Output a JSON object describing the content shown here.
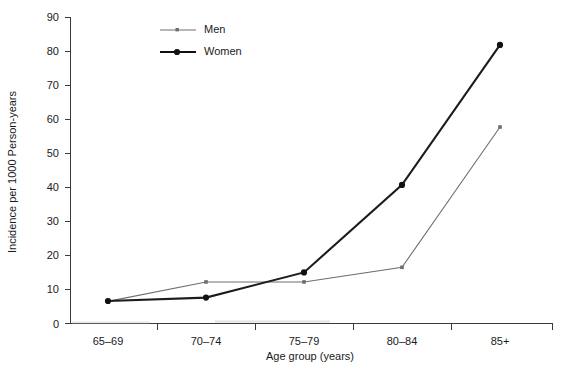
{
  "chart_data": {
    "type": "line",
    "title": "",
    "xlabel": "Age group (years)",
    "ylabel": "Incidence per 1000 Person-years",
    "categories": [
      "65–69",
      "70–74",
      "75–79",
      "80–84",
      "85+"
    ],
    "ylim": [
      0,
      90
    ],
    "yticks": [
      0,
      10,
      20,
      30,
      40,
      50,
      60,
      70,
      80,
      90
    ],
    "ytick_labels": [
      "0",
      "10",
      "20",
      "30",
      "40",
      "50",
      "60",
      "70",
      "80",
      "90"
    ],
    "grid": false,
    "legend_position": "top-left-inside",
    "series": [
      {
        "name": "Men",
        "values": [
          6.5,
          12.2,
          12.2,
          16.5,
          57.7
        ],
        "color": "#6e6e6e",
        "marker": "small-square",
        "line_width": 1.1
      },
      {
        "name": "Women",
        "values": [
          6.6,
          7.6,
          15.0,
          40.7,
          81.8
        ],
        "color": "#111111",
        "marker": "filled-circle",
        "line_width": 2.1
      }
    ]
  },
  "legend": {
    "entries": [
      {
        "label": "Men"
      },
      {
        "label": "Women"
      }
    ]
  },
  "axes": {
    "y_title": "Incidence per 1000 Person-years",
    "x_title": "Age group (years)"
  }
}
